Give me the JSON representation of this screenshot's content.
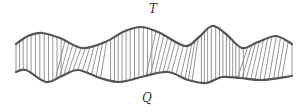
{
  "labels": {
    "top_curve": "T",
    "bottom_curve": "Q"
  },
  "colors": {
    "curve": "#555555",
    "hatch": "#8a8a8a",
    "background": "#ffffff"
  },
  "curves": {
    "top": [
      [
        16,
        44
      ],
      [
        28,
        36
      ],
      [
        42,
        33
      ],
      [
        60,
        38
      ],
      [
        82,
        48
      ],
      [
        105,
        42
      ],
      [
        125,
        31
      ],
      [
        142,
        27
      ],
      [
        160,
        33
      ],
      [
        185,
        46
      ],
      [
        198,
        38
      ],
      [
        212,
        26
      ],
      [
        226,
        34
      ],
      [
        242,
        48
      ],
      [
        258,
        42
      ],
      [
        276,
        36
      ],
      [
        292,
        44
      ]
    ],
    "bottom": [
      [
        16,
        72
      ],
      [
        26,
        70
      ],
      [
        46,
        82
      ],
      [
        62,
        76
      ],
      [
        78,
        70
      ],
      [
        100,
        78
      ],
      [
        120,
        82
      ],
      [
        145,
        76
      ],
      [
        168,
        72
      ],
      [
        188,
        80
      ],
      [
        206,
        83
      ],
      [
        222,
        77
      ],
      [
        240,
        78
      ],
      [
        262,
        80
      ],
      [
        292,
        76
      ]
    ]
  },
  "hatch_count": 70
}
